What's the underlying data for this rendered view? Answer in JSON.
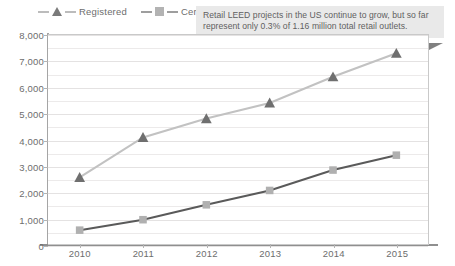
{
  "callout": {
    "text": "Retail LEED projects in the US continue to grow, but so far represent only 0.3% of 1.16 million total retail outlets."
  },
  "legend": {
    "entries": [
      {
        "label": "Registered",
        "marker": "triangle",
        "color": "#6f6f6f",
        "line_color": "#c2c2c2"
      },
      {
        "label": "Certified",
        "marker": "square",
        "color": "#b0b0b0",
        "line_color": "#5a5a5a"
      }
    ]
  },
  "chart_data": {
    "type": "line",
    "title": "",
    "xlabel": "",
    "ylabel": "",
    "categories": [
      "2010",
      "2011",
      "2012",
      "2013",
      "2014",
      "2015"
    ],
    "series": [
      {
        "name": "Registered",
        "values": [
          2550,
          4080,
          4800,
          5400,
          6400,
          7300
        ]
      },
      {
        "name": "Certified",
        "values": [
          530,
          930,
          1500,
          2050,
          2830,
          3400
        ]
      }
    ],
    "ylim": [
      0,
      8000
    ],
    "ytick_labels": [
      "0",
      "1,000",
      "2,000",
      "3,000",
      "4,000",
      "5,000",
      "6,000",
      "7,000",
      "8,000"
    ],
    "ytick_values": [
      0,
      1000,
      2000,
      3000,
      4000,
      5000,
      6000,
      7000,
      8000
    ],
    "minor_gridlines": true,
    "grid": true,
    "legend_position": "top-left"
  }
}
